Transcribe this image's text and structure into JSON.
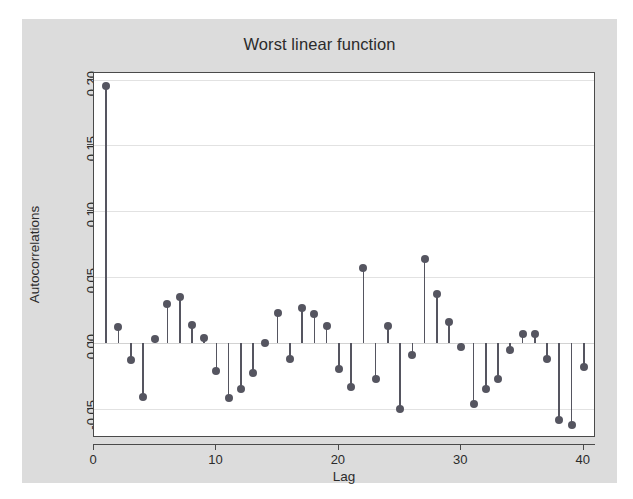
{
  "figure": {
    "background_color": "#dcdcdc",
    "panel_color": "#ffffff",
    "marker_color": "#555560",
    "axis_color": "#4a4a4a",
    "grid_color": "#e2e2e2"
  },
  "chart_data": {
    "type": "line",
    "title": "Worst linear function",
    "xlabel": "Lag",
    "ylabel": "Autocorrelations",
    "xlim": [
      0,
      41
    ],
    "ylim": [
      -0.072,
      0.205
    ],
    "xticks": [
      0,
      10,
      20,
      30,
      40
    ],
    "xtick_labels": [
      "0",
      "10",
      "20",
      "30",
      "40"
    ],
    "yticks": [
      -0.05,
      0.0,
      0.05,
      0.1,
      0.15,
      0.2
    ],
    "ytick_labels": [
      "-0.05",
      "0.00",
      "0.05",
      "0.10",
      "0.15",
      "0.20"
    ],
    "grid": true,
    "legend": "none",
    "plot_style": "stem / correlogram (spikes with round markers)",
    "x": [
      1,
      2,
      3,
      4,
      5,
      6,
      7,
      8,
      9,
      10,
      11,
      12,
      13,
      14,
      15,
      16,
      17,
      18,
      19,
      20,
      21,
      22,
      23,
      24,
      25,
      26,
      27,
      28,
      29,
      30,
      31,
      32,
      33,
      34,
      35,
      36,
      37,
      38,
      39,
      40
    ],
    "values": [
      0.195,
      0.012,
      -0.013,
      -0.041,
      0.003,
      0.03,
      0.035,
      0.014,
      0.004,
      -0.021,
      -0.042,
      -0.035,
      -0.023,
      0.0,
      0.023,
      -0.012,
      0.027,
      0.022,
      0.013,
      -0.02,
      -0.033,
      0.057,
      -0.027,
      0.013,
      -0.05,
      -0.009,
      0.064,
      0.037,
      0.016,
      -0.003,
      -0.046,
      -0.035,
      -0.027,
      -0.005,
      0.007,
      0.007,
      -0.012,
      -0.058,
      -0.062,
      -0.018
    ]
  }
}
